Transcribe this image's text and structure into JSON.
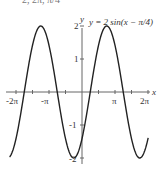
{
  "header_fragment": "2, 2π, π/4",
  "chart_data": {
    "type": "line",
    "title": "",
    "annotation": "y = 2 sin(x − π/4)",
    "xlabel": "x",
    "ylabel": "y",
    "xlim": [
      -6.9,
      6.4
    ],
    "ylim": [
      -2.1,
      2.1
    ],
    "x_ticks": [
      "-2π",
      "-π",
      "π",
      "2π"
    ],
    "y_ticks": [
      "2",
      "1",
      "-1",
      "-2"
    ],
    "grid": false,
    "series": [
      {
        "name": "y = 2 sin(x − π/4)",
        "function": "2*sin(x - pi/4)",
        "x_range": [
          -6.9,
          6.3
        ],
        "color": "#222222"
      }
    ]
  },
  "labels": {
    "x_axis": "x",
    "y_axis": "y",
    "xt1": "-2π",
    "xt2": "-π",
    "xt3": "π",
    "xt4": "2π",
    "yt1": "2",
    "yt2": "1",
    "yt3": "-1",
    "yt4": "-2"
  }
}
